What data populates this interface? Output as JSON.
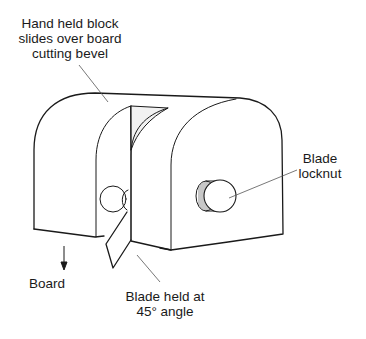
{
  "diagram": {
    "type": "technical line drawing",
    "labels": {
      "top": "Hand held block slides over board cutting bevel",
      "top_lines": [
        "Hand held block",
        "slides over board",
        "cutting bevel"
      ],
      "locknut_lines": [
        "Blade",
        "locknut"
      ],
      "board": "Board",
      "blade_lines": [
        "Blade held at",
        "45° angle"
      ]
    },
    "colors": {
      "line": "#1a1a1a",
      "leader": "#555555",
      "background": "#ffffff",
      "blade_shade": "#f0f0f0"
    }
  }
}
